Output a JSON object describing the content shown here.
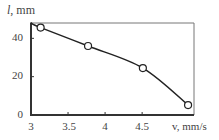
{
  "chart_data": {
    "type": "line",
    "title": "",
    "xlabel": "v, mm/s",
    "ylabel_var": "l",
    "ylabel_unit": ", mm",
    "xlim": [
      3,
      5.2
    ],
    "ylim": [
      0,
      48
    ],
    "x_ticks": [
      3,
      3.5,
      4,
      4.5
    ],
    "x_tick_labels": [
      "3",
      "3.5",
      "4",
      "4.5"
    ],
    "y_ticks": [
      0,
      20,
      40
    ],
    "y_tick_labels": [
      "0",
      "20",
      "40"
    ],
    "grid": false,
    "legend": null,
    "series": [
      {
        "name": "l(v)",
        "marker": "open-circle",
        "x": [
          3.13,
          3.77,
          4.51,
          5.12
        ],
        "values": [
          45.6,
          36,
          24.5,
          5.2
        ]
      }
    ],
    "curve_start": {
      "x": 3.0,
      "y": 48
    }
  },
  "colors": {
    "axis": "#333333",
    "line": "#222222",
    "marker_fill": "#ffffff"
  }
}
